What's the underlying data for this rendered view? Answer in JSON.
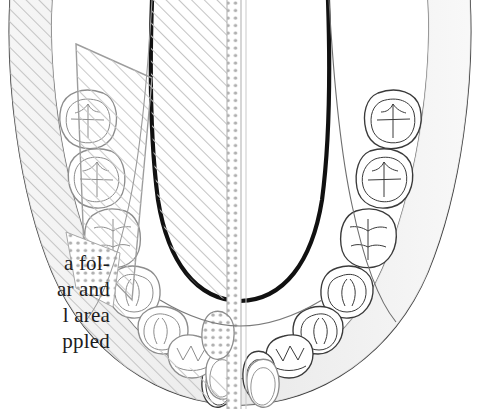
{
  "figure": {
    "orientation": "occlusal view, anterior at bottom"
  },
  "caption": {
    "lines": [
      "a fol-",
      "ar and",
      "l area",
      "ppled"
    ],
    "note": "text is cropped at the left page edge"
  },
  "colors": {
    "background": "#ffffff",
    "outline_thick": "#111111",
    "outline_thin": "#4a4a4a",
    "tooth_line_right": "#3a3a3a",
    "tooth_line_left": "#9a9a9a",
    "hatch": "#c8c8c8",
    "stipple": "#b0b0b0",
    "bone_shade": "#ededed"
  },
  "regions": [
    {
      "name": "tongue-outline",
      "label": "Thick-outlined central region (tongue / floor of mouth)",
      "fill_left": "diagonal-hatch",
      "fill_right": "none"
    },
    {
      "name": "midline-stipple-band",
      "label": "Stippled band along the dental midline",
      "pattern": "stipple"
    },
    {
      "name": "left-buccal-stipple-patch",
      "label": "Stippled patch over the left buccal sulcus",
      "pattern": "stipple"
    },
    {
      "name": "left-hatch-overlay",
      "label": "Diagonal hatch overlay covering the entire left half of the arch",
      "pattern": "diagonal-hatch"
    },
    {
      "name": "left-central-incisor-stipple",
      "label": "Stippled left central incisor",
      "pattern": "stipple"
    }
  ],
  "teeth": {
    "right_quadrant": [
      {
        "position": 1,
        "name": "third-molar",
        "cusp_pattern": "cross-fissure"
      },
      {
        "position": 2,
        "name": "second-molar",
        "cusp_pattern": "cross-fissure"
      },
      {
        "position": 3,
        "name": "first-molar",
        "cusp_pattern": "branched-fissure"
      },
      {
        "position": 4,
        "name": "second-premolar",
        "cusp_pattern": "two-cusp"
      },
      {
        "position": 5,
        "name": "first-premolar",
        "cusp_pattern": "two-cusp"
      },
      {
        "position": 6,
        "name": "canine",
        "cusp_pattern": "pointed"
      },
      {
        "position": 7,
        "name": "lateral-incisor",
        "cusp_pattern": "flat-incisal"
      },
      {
        "position": 8,
        "name": "central-incisor",
        "cusp_pattern": "flat-incisal"
      }
    ],
    "left_quadrant": [
      {
        "position": 1,
        "name": "third-molar",
        "cusp_pattern": "cross-fissure"
      },
      {
        "position": 2,
        "name": "second-molar",
        "cusp_pattern": "cross-fissure"
      },
      {
        "position": 3,
        "name": "first-molar",
        "cusp_pattern": "branched-fissure"
      },
      {
        "position": 4,
        "name": "second-premolar",
        "cusp_pattern": "two-cusp"
      },
      {
        "position": 5,
        "name": "first-premolar",
        "cusp_pattern": "two-cusp"
      },
      {
        "position": 6,
        "name": "canine",
        "cusp_pattern": "pointed"
      },
      {
        "position": 7,
        "name": "lateral-incisor",
        "cusp_pattern": "flat-incisal"
      },
      {
        "position": 8,
        "name": "central-incisor",
        "cusp_pattern": "flat-incisal"
      }
    ]
  }
}
